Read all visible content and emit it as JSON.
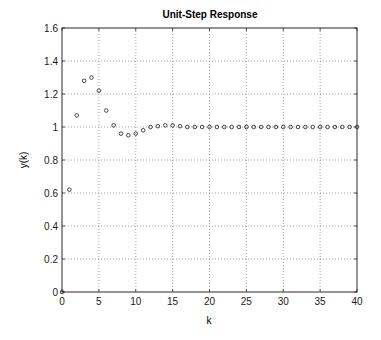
{
  "chart_data": {
    "type": "scatter",
    "title": "Unit-Step Response",
    "xlabel": "k",
    "ylabel": "y(k)",
    "xlim": [
      0,
      40
    ],
    "ylim": [
      0,
      1.6
    ],
    "grid": true,
    "grid_style": "dotted",
    "marker": "circle-open",
    "xticks": [
      0,
      5,
      10,
      15,
      20,
      25,
      30,
      35,
      40
    ],
    "yticks": [
      0,
      0.2,
      0.4,
      0.6,
      0.8,
      1,
      1.2,
      1.4,
      1.6
    ],
    "xtick_labels": [
      "0",
      "5",
      "10",
      "15",
      "20",
      "25",
      "30",
      "35",
      "40"
    ],
    "ytick_labels": [
      "0",
      "0.2",
      "0.4",
      "0.6",
      "0.8",
      "1",
      "1.2",
      "1.4",
      "1.6"
    ],
    "legend": null,
    "series": [
      {
        "name": "y(k)",
        "x": [
          0,
          1,
          2,
          3,
          4,
          5,
          6,
          7,
          8,
          9,
          10,
          11,
          12,
          13,
          14,
          15,
          16,
          17,
          18,
          19,
          20,
          21,
          22,
          23,
          24,
          25,
          26,
          27,
          28,
          29,
          30,
          31,
          32,
          33,
          34,
          35,
          36,
          37,
          38,
          39,
          40
        ],
        "values": [
          0,
          0.62,
          1.07,
          1.28,
          1.3,
          1.22,
          1.1,
          1.01,
          0.96,
          0.95,
          0.96,
          0.98,
          1.0,
          1.005,
          1.01,
          1.01,
          1.005,
          1.0,
          1.0,
          1.0,
          1.0,
          1.0,
          1.0,
          1.0,
          1.0,
          1.0,
          1.0,
          1.0,
          1.0,
          1.0,
          1.0,
          1.0,
          1.0,
          1.0,
          1.0,
          1.0,
          1.0,
          1.0,
          1.0,
          1.0,
          1.0
        ]
      }
    ]
  },
  "colors": {
    "axis": "#2a2a2a",
    "grid": "#8a8a8a",
    "marker": "#333333",
    "text": "#1a1a1a"
  }
}
